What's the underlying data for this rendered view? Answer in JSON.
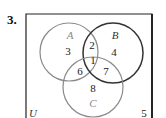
{
  "problem": {
    "number": "3."
  },
  "universe": {
    "label": "U",
    "outside_value": "5"
  },
  "sets": [
    {
      "name": "A",
      "color": "#8a8a8a",
      "cx": 69,
      "cy": 52,
      "r": 29,
      "label_x": 70,
      "label_y": 39
    },
    {
      "name": "B",
      "color": "#333333",
      "cx": 113,
      "cy": 53,
      "r": 30,
      "label_x": 115,
      "label_y": 39
    },
    {
      "name": "C",
      "color": "#8a8a8a",
      "cx": 93,
      "cy": 87,
      "r": 30,
      "label_x": 93,
      "label_y": 107
    }
  ],
  "regions": [
    {
      "name": "A-only",
      "value": "3",
      "x": 68,
      "y": 55
    },
    {
      "name": "A-and-B",
      "value": "2",
      "x": 92,
      "y": 49
    },
    {
      "name": "B-only",
      "value": "4",
      "x": 114,
      "y": 56
    },
    {
      "name": "A-B-C",
      "value": "1",
      "x": 93,
      "y": 64
    },
    {
      "name": "A-and-C",
      "value": "6",
      "x": 80,
      "y": 75
    },
    {
      "name": "B-and-C",
      "value": "7",
      "x": 106,
      "y": 75
    },
    {
      "name": "C-only",
      "value": "8",
      "x": 93,
      "y": 92
    }
  ]
}
